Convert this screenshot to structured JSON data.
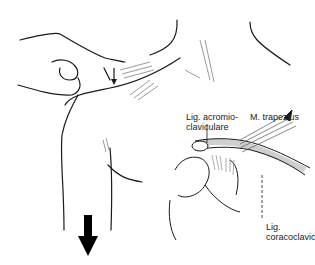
{
  "figure": {
    "labels": {
      "acromioclavicular": {
        "line1": "Lig. acromio-",
        "line2": "claviculare"
      },
      "trapezius": {
        "line1": "M. trapezius"
      },
      "coracoclavicular": {
        "line1": "Lig.",
        "line2": "coracoclaviculare"
      }
    },
    "arrows": [
      {
        "name": "pressure-arrow",
        "direction": "down",
        "size": "small"
      },
      {
        "name": "traction-arrow",
        "direction": "down",
        "size": "large"
      }
    ],
    "colors": {
      "ink": "#1a1a1a",
      "background": "#ffffff",
      "shade": "#8a8a8a"
    }
  }
}
